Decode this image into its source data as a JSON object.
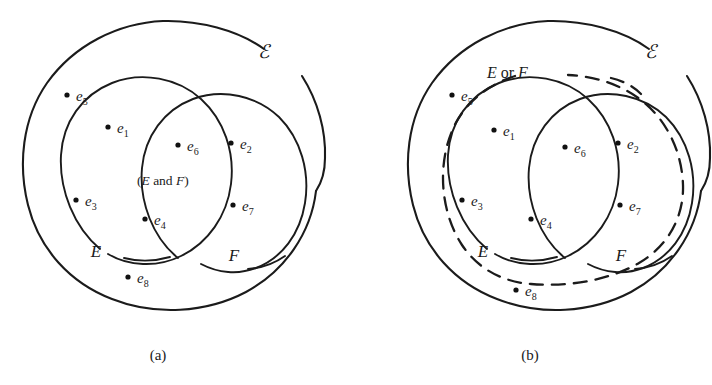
{
  "figure": {
    "background_color": "#ffffff",
    "ink_color": "#1b1b1b",
    "universal_set_symbol": "ℰ"
  },
  "panels": [
    {
      "id": "a",
      "caption": "(a)",
      "universe_label": "ℰ",
      "set_e_label": "E",
      "set_f_label": "F",
      "region_label": "(E and F)",
      "region_label_parts": {
        "open": "(",
        "first": "E",
        "conj": " and ",
        "second": "F",
        "close": ")"
      },
      "boundary_style": "solid",
      "points": [
        {
          "id": "e1",
          "letter": "e",
          "sub": "1",
          "region": "E only"
        },
        {
          "id": "e2",
          "letter": "e",
          "sub": "2",
          "region": "F only"
        },
        {
          "id": "e3",
          "letter": "e",
          "sub": "3",
          "region": "E only"
        },
        {
          "id": "e4",
          "letter": "e",
          "sub": "4",
          "region": "E and F"
        },
        {
          "id": "e5",
          "letter": "e",
          "sub": "5",
          "region": "outside E and F"
        },
        {
          "id": "e6",
          "letter": "e",
          "sub": "6",
          "region": "E and F"
        },
        {
          "id": "e7",
          "letter": "e",
          "sub": "7",
          "region": "F only"
        },
        {
          "id": "e8",
          "letter": "e",
          "sub": "8",
          "region": "outside E and F"
        }
      ]
    },
    {
      "id": "b",
      "caption": "(b)",
      "universe_label": "ℰ",
      "set_e_label": "E",
      "set_f_label": "F",
      "region_label": "E or F",
      "region_label_parts": {
        "first": "E",
        "conj": " or ",
        "second": "F"
      },
      "boundary_style": "dashed",
      "points": [
        {
          "id": "e1",
          "letter": "e",
          "sub": "1",
          "region": "E only"
        },
        {
          "id": "e2",
          "letter": "e",
          "sub": "2",
          "region": "F only"
        },
        {
          "id": "e3",
          "letter": "e",
          "sub": "3",
          "region": "E only"
        },
        {
          "id": "e4",
          "letter": "e",
          "sub": "4",
          "region": "E and F"
        },
        {
          "id": "e5",
          "letter": "e",
          "sub": "5",
          "region": "outside E or F"
        },
        {
          "id": "e6",
          "letter": "e",
          "sub": "6",
          "region": "E and F"
        },
        {
          "id": "e7",
          "letter": "e",
          "sub": "7",
          "region": "F only"
        },
        {
          "id": "e8",
          "letter": "e",
          "sub": "8",
          "region": "outside E or F"
        }
      ]
    }
  ]
}
